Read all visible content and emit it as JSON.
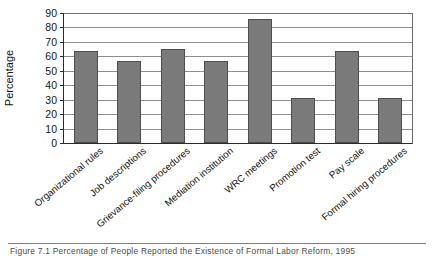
{
  "chart_data": {
    "type": "bar",
    "title": "",
    "xlabel": "",
    "ylabel": "Percentage",
    "ylim": [
      0,
      90
    ],
    "ytick_step": 10,
    "yticks": [
      90,
      80,
      70,
      60,
      50,
      40,
      30,
      20,
      10,
      0
    ],
    "grid": true,
    "grid_axis": "y",
    "legend": false,
    "bar_color": "#7a7a7a",
    "bar_edge_color": "#4e4e4e",
    "categories": [
      "Organizational rules",
      "Job descriptions",
      "Grievance-filing procedures",
      "Mediation institution",
      "WRC meetings",
      "Promotion test",
      "Pay scale",
      "Formal hiring procedures"
    ],
    "values": [
      64,
      57,
      65,
      57,
      86,
      31,
      64,
      31
    ]
  },
  "axis": {
    "y_title": "Percentage"
  },
  "caption": {
    "text": "Figure 7.1  Percentage of People Reported the Existence of Formal Labor Reform, 1995"
  }
}
